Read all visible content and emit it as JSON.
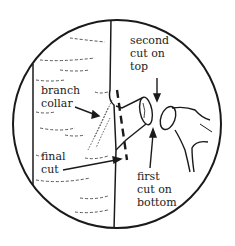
{
  "diagram": {
    "colors": {
      "ink": "#1a1a1a",
      "background": "#ffffff"
    },
    "labels": {
      "second_cut": {
        "line1": "second",
        "line2": "cut on",
        "line3": "top"
      },
      "branch_collar": {
        "line1": "branch",
        "line2": "collar"
      },
      "final_cut": {
        "line1": "final",
        "line2": "cut"
      },
      "first_cut": {
        "line1": "first",
        "line2": "cut on",
        "line3": "bottom"
      }
    }
  }
}
